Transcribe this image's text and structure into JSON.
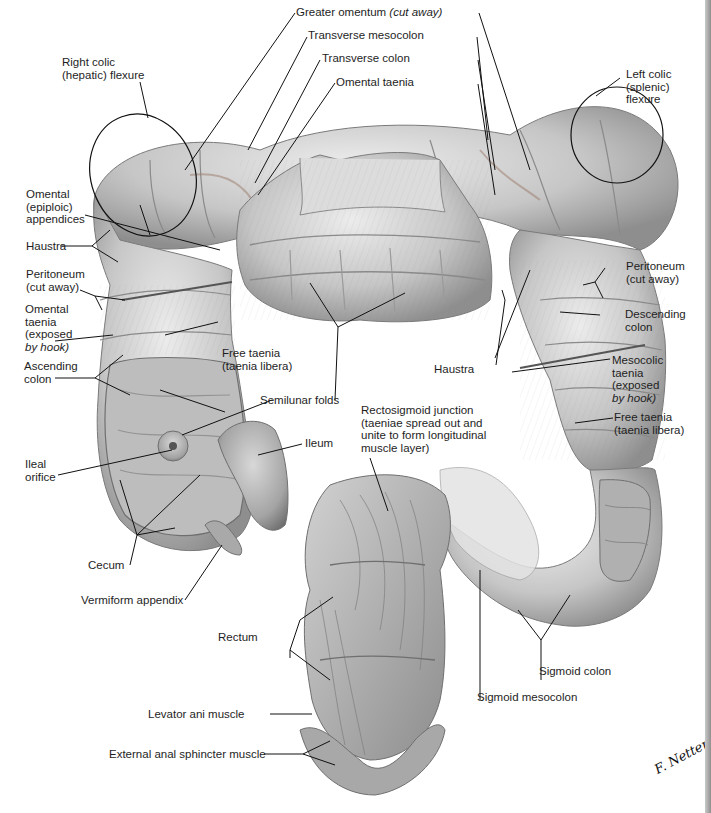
{
  "figure": {
    "signature": "F. Netter",
    "colors": {
      "background": "#ffffff",
      "tissue_light": "#d9d9d9",
      "tissue_mid": "#b5b5b5",
      "tissue_dark": "#8a8a8a",
      "line": "#1a1a1a",
      "edge_strip": "#9a9a9a"
    }
  },
  "labels": {
    "greater_omentum": {
      "text": "Greater omentum",
      "note": "(cut away)"
    },
    "transverse_mesocolon": "Transverse mesocolon",
    "transverse_colon": "Transverse colon",
    "omental_taenia_top": "Omental taenia",
    "right_colic_flexure": [
      "Right colic",
      "(hepatic) flexure"
    ],
    "left_colic_flexure": [
      "Left colic",
      "(splenic)",
      "flexure"
    ],
    "omental_appendices": [
      "Omental",
      "(epiploic)",
      "appendices"
    ],
    "haustra_left": "Haustra",
    "peritoneum_left": [
      "Peritoneum",
      "(cut away)"
    ],
    "omental_taenia_left": [
      "Omental",
      "taenia",
      "(exposed",
      "by hook)"
    ],
    "free_taenia_left": [
      "Free taenia",
      "(taenia libera)"
    ],
    "ascending_colon": [
      "Ascending",
      "colon"
    ],
    "semilunar_folds": "Semilunar folds",
    "ileal_orifice": [
      "Ileal",
      "orifice"
    ],
    "ileum": "Ileum",
    "cecum": "Cecum",
    "vermiform_appendix": "Vermiform appendix",
    "peritoneum_right": [
      "Peritoneum",
      "(cut away)"
    ],
    "descending_colon": [
      "Descending",
      "colon"
    ],
    "haustra_right": "Haustra",
    "mesocolic_taenia": [
      "Mesocolic",
      "taenia",
      "(exposed",
      "by hook)"
    ],
    "free_taenia_right": [
      "Free taenia",
      "(taenia libera)"
    ],
    "rectosigmoid_junction": [
      "Rectosigmoid junction",
      "(taeniae spread out and",
      "unite to form longitudinal",
      "muscle layer)"
    ],
    "rectum": "Rectum",
    "sigmoid_colon": "Sigmoid colon",
    "sigmoid_mesocolon": "Sigmoid mesocolon",
    "levator_ani": "Levator ani muscle",
    "external_anal_sphincter": "External anal sphincter muscle"
  }
}
